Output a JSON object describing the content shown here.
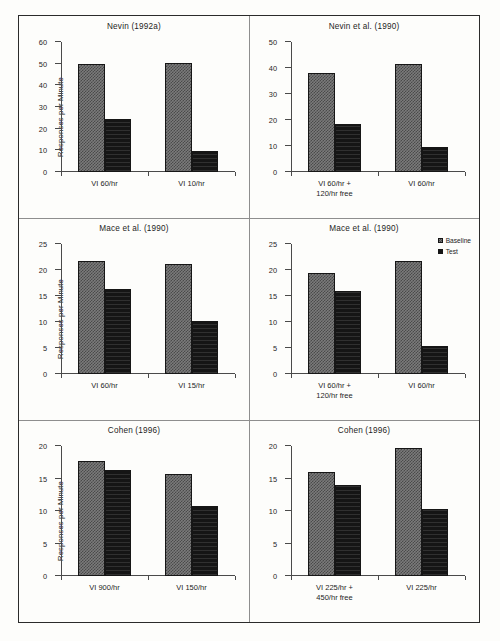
{
  "figure": {
    "ylabel": "Responses per Minute",
    "legend": {
      "position": "top-right of middle-right panel",
      "entries": [
        {
          "label": "Baseline",
          "swatch": "hatched-gray"
        },
        {
          "label": "Test",
          "swatch": "solid-black"
        }
      ]
    }
  },
  "chart_data": [
    {
      "type": "bar",
      "panel": "top-left",
      "title": "Nevin (1992a)",
      "xlabel": "",
      "ylabel": "Responses per Minute",
      "ylim": [
        0,
        60
      ],
      "yticks": [
        0,
        10,
        20,
        30,
        40,
        50,
        60
      ],
      "grid": false,
      "categories": [
        "VI 60/hr",
        "VI 10/hr"
      ],
      "series": [
        {
          "name": "Baseline",
          "values": [
            49.7,
            50.5
          ]
        },
        {
          "name": "Test",
          "values": [
            24.6,
            9.6
          ]
        }
      ]
    },
    {
      "type": "bar",
      "panel": "top-right",
      "title": "Nevin et al. (1990)",
      "xlabel": "",
      "ylabel": "",
      "ylim": [
        0,
        50
      ],
      "yticks": [
        0,
        10,
        20,
        30,
        40,
        50
      ],
      "grid": false,
      "categories": [
        "VI 60/hr + 120/hr free",
        "VI 60/hr"
      ],
      "categories_lines": [
        [
          "VI 60/hr +",
          "120/hr free"
        ],
        [
          "VI 60/hr"
        ]
      ],
      "series": [
        {
          "name": "Baseline",
          "values": [
            38.0,
            41.6
          ]
        },
        {
          "name": "Test",
          "values": [
            18.3,
            9.6
          ]
        }
      ]
    },
    {
      "type": "bar",
      "panel": "middle-left",
      "title": "Mace et al. (1990)",
      "xlabel": "",
      "ylabel": "Responses per Minute",
      "ylim": [
        0,
        25
      ],
      "yticks": [
        0,
        5,
        10,
        15,
        20,
        25
      ],
      "grid": false,
      "categories": [
        "VI 60/hr",
        "VI 15/hr"
      ],
      "series": [
        {
          "name": "Baseline",
          "values": [
            21.8,
            21.2
          ]
        },
        {
          "name": "Test",
          "values": [
            16.3,
            10.2
          ]
        }
      ]
    },
    {
      "type": "bar",
      "panel": "middle-right",
      "title": "Mace et al. (1990)",
      "xlabel": "",
      "ylabel": "",
      "ylim": [
        0,
        25
      ],
      "yticks": [
        0,
        5,
        10,
        15,
        20,
        25
      ],
      "grid": false,
      "categories": [
        "VI 60/hr + 120/hr free",
        "VI 60/hr"
      ],
      "categories_lines": [
        [
          "VI 60/hr +",
          "120/hr free"
        ],
        [
          "VI 60/hr"
        ]
      ],
      "series": [
        {
          "name": "Baseline",
          "values": [
            19.5,
            21.7
          ]
        },
        {
          "name": "Test",
          "values": [
            15.9,
            5.3
          ]
        }
      ]
    },
    {
      "type": "bar",
      "panel": "bottom-left",
      "title": "Cohen (1996)",
      "xlabel": "",
      "ylabel": "Responses per Minute",
      "ylim": [
        0,
        20
      ],
      "yticks": [
        0,
        5,
        10,
        15,
        20
      ],
      "grid": false,
      "categories": [
        "VI 900/hr",
        "VI 150/hr"
      ],
      "series": [
        {
          "name": "Baseline",
          "values": [
            17.7,
            15.7
          ]
        },
        {
          "name": "Test",
          "values": [
            16.3,
            10.8
          ]
        }
      ]
    },
    {
      "type": "bar",
      "panel": "bottom-right",
      "title": "Cohen (1996)",
      "xlabel": "",
      "ylabel": "",
      "ylim": [
        0,
        20
      ],
      "yticks": [
        0,
        5,
        10,
        15,
        20
      ],
      "grid": false,
      "categories": [
        "VI 225/hr + 450/hr free",
        "VI 225/hr"
      ],
      "categories_lines": [
        [
          "VI 225/hr +",
          "450/hr free"
        ],
        [
          "VI 225/hr"
        ]
      ],
      "series": [
        {
          "name": "Baseline",
          "values": [
            16.0,
            19.7
          ]
        },
        {
          "name": "Test",
          "values": [
            14.0,
            10.3
          ]
        }
      ]
    }
  ]
}
